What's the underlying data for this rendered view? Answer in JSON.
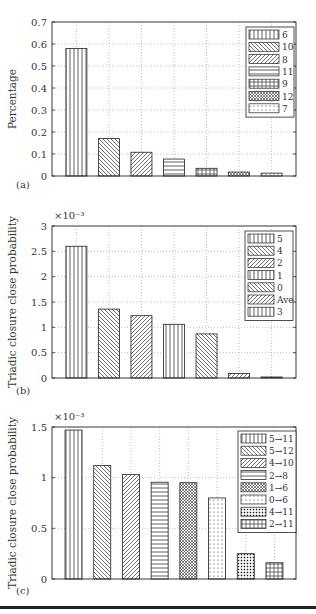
{
  "chart_data": [
    {
      "type": "bar",
      "panel_label": "(a)",
      "title": "",
      "xlabel": "",
      "ylabel": "Percentage",
      "y_multiplier": "",
      "ylim": [
        0,
        0.7
      ],
      "yticks": [
        0,
        0.1,
        0.2,
        0.3,
        0.4,
        0.5,
        0.6,
        0.7
      ],
      "ytick_labels": [
        "0",
        "0.1",
        "0.2",
        "0.3",
        "0.4",
        "0.5",
        "0.6",
        "0.7"
      ],
      "grid": true,
      "legend_position": "top-right",
      "categories": [
        "6",
        "10",
        "8",
        "11",
        "9",
        "12",
        "7"
      ],
      "values": [
        0.58,
        0.17,
        0.108,
        0.077,
        0.035,
        0.018,
        0.013
      ],
      "patterns": [
        "vertical",
        "diag-down",
        "diag-up",
        "horizontal",
        "grid",
        "crosshatch",
        "dots"
      ]
    },
    {
      "type": "bar",
      "panel_label": "(b)",
      "title": "",
      "xlabel": "",
      "ylabel": "Triadic closure close probability",
      "y_multiplier": "×10⁻³",
      "ylim": [
        0,
        3
      ],
      "yticks": [
        0,
        0.5,
        1,
        1.5,
        2,
        2.5,
        3
      ],
      "ytick_labels": [
        "0",
        "0.5",
        "1",
        "1.5",
        "2",
        "2.5",
        "3"
      ],
      "grid": true,
      "legend_position": "top-right",
      "categories": [
        "5",
        "4",
        "2",
        "1",
        "0",
        "Ave",
        "3"
      ],
      "values": [
        2.6,
        1.36,
        1.23,
        1.06,
        0.87,
        0.09,
        0.02
      ],
      "patterns": [
        "vertical",
        "diag-down",
        "diag-up",
        "vertical",
        "diag-down",
        "diag-up",
        "vertical"
      ]
    },
    {
      "type": "bar",
      "panel_label": "(c)",
      "title": "",
      "xlabel": "",
      "ylabel": "Triadic closure close probability",
      "y_multiplier": "×10⁻³",
      "ylim": [
        0,
        1.5
      ],
      "yticks": [
        0,
        0.5,
        1,
        1.5
      ],
      "ytick_labels": [
        "0",
        "0.5",
        "1",
        "1.5"
      ],
      "grid": true,
      "legend_position": "top-right",
      "categories": [
        "5→11",
        "5→12",
        "4→10",
        "2→8",
        "1→6",
        "0→6",
        "4→11",
        "2→11"
      ],
      "values": [
        1.47,
        1.12,
        1.03,
        0.955,
        0.95,
        0.8,
        0.25,
        0.16
      ],
      "patterns": [
        "vertical",
        "diag-down",
        "diag-up",
        "horizontal",
        "crosshatch",
        "dots",
        "dense-dots",
        "grid"
      ]
    }
  ]
}
